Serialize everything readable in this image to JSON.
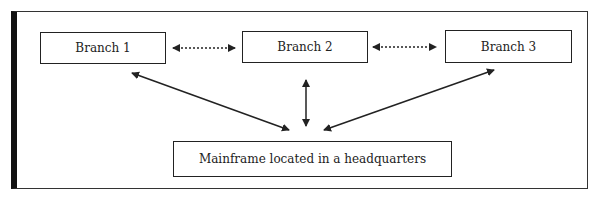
{
  "diagram": {
    "nodes": {
      "branch1": "Branch 1",
      "branch2": "Branch 2",
      "branch3": "Branch 3",
      "mainframe": "Mainframe located in a headquarters"
    },
    "edges": [
      {
        "from": "branch1",
        "to": "branch2",
        "style": "dotted",
        "direction": "both"
      },
      {
        "from": "branch2",
        "to": "branch3",
        "style": "dotted",
        "direction": "both"
      },
      {
        "from": "mainframe",
        "to": "branch1",
        "style": "solid",
        "direction": "both"
      },
      {
        "from": "mainframe",
        "to": "branch2",
        "style": "solid",
        "direction": "both"
      },
      {
        "from": "mainframe",
        "to": "branch3",
        "style": "solid",
        "direction": "both"
      }
    ]
  }
}
